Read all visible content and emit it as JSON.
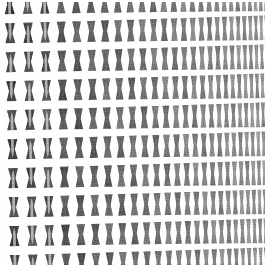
{
  "image": {
    "title": "Perforated triangular lattice panel",
    "subject": "perforated-metal-mesh",
    "width": 265,
    "height": 265,
    "background_color": "#ffffff",
    "description": "Photograph of a flat perforated panel pierced with a triangular lattice of holes, viewed at an oblique angle so the pattern compresses toward the right edge.",
    "alt_text": "A white panel covered in a repeating grid of dark triangular perforations that grow smaller and closer together from left to right."
  },
  "pattern": {
    "type": "triangular-lattice",
    "motif": "alternating up-pointing and down-pointing triangles",
    "ground_color": "#fbfbfb",
    "strut_color": "#ffffff",
    "triangle_fill_dark": "#3c3c3c",
    "triangle_fill_mid": "#585858",
    "triangle_fill_light": "#787878",
    "triangle_fill_faint": "#8e8e8e",
    "rows": 10,
    "row_height_px": 29,
    "columns": 26,
    "column_width_left_px": 30,
    "column_width_right_px": 8,
    "strut_width_left_px": 6.5,
    "strut_width_right_px": 2.2,
    "corner_radius_px": 1.6,
    "rotation_deg": -1.2,
    "margin_top_px": 3,
    "margin_left_px": 3
  },
  "gradient": {
    "direction": "left-to-right",
    "effect": "perspective-foreshortening",
    "left_scale": 1.0,
    "right_scale": 0.27,
    "tone_left": "#3c3c3c",
    "tone_right": "#8a8a8a",
    "brightness_left_pct": 24,
    "brightness_right_pct": 55
  },
  "texture": {
    "type": "fine-grain-noise",
    "intensity_pct": 13,
    "note": "subtle horizontal scanline grain inside each dark triangle"
  },
  "edges": {
    "top": "triangles clipped mid-row",
    "bottom": "triangles clipped mid-row",
    "left": "narrow white margin then partial triangles",
    "right": "dense fine triangles running to the border"
  }
}
